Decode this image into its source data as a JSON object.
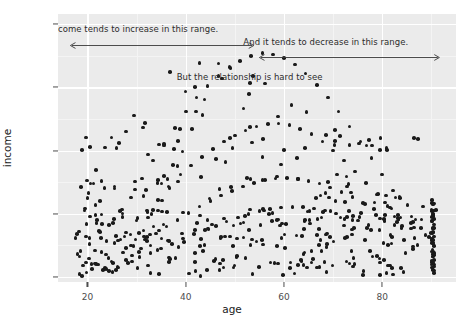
{
  "chart_data": {
    "type": "scatter",
    "title": "",
    "xlabel": "age",
    "ylabel": "income",
    "xlim": [
      14,
      95
    ],
    "ylim": [
      -4000,
      208000
    ],
    "x_ticks": [
      20,
      40,
      60,
      80
    ],
    "y_ticks": [
      0,
      50000,
      100000,
      150000,
      200000
    ],
    "x_tick_labels": [
      "20",
      "40",
      "60",
      "80"
    ],
    "y_tick_labels": [
      "0",
      "50000",
      "100000",
      "150000",
      "200000"
    ],
    "x_minor_ticks": [
      10,
      30,
      50,
      70,
      90
    ],
    "y_minor_ticks": [
      25000,
      75000,
      125000,
      175000
    ],
    "grid": true,
    "legend": "none",
    "point_color": "#1a1a1a",
    "panel_background": "#ebebeb",
    "gridline_color": "#ffffff",
    "annotations": [
      {
        "id": "annotation-increase",
        "text": "Income tends to increase in this range.",
        "text_x": 29.5,
        "text_y": 196000,
        "arrow": {
          "x_start": 16.3,
          "x_end": 54.2,
          "y": 188000,
          "style": "double-headed"
        }
      },
      {
        "id": "annotation-decrease",
        "text": "And it tends to decrease in this range.",
        "text_x": 68.5,
        "text_y": 186000,
        "arrow": {
          "x_start": 54.8,
          "x_end": 92.0,
          "y": 178000,
          "style": "double-headed"
        }
      },
      {
        "id": "annotation-hard-to-see",
        "text": "But the relationship is hard to see",
        "text_x": 53.0,
        "text_y": 158000,
        "arrow": null
      }
    ],
    "n_points": 560,
    "points": [
      [
        18.4,
        2100
      ],
      [
        19.1,
        8900
      ],
      [
        19.8,
        3400
      ],
      [
        20.3,
        14500
      ],
      [
        20.9,
        6200
      ],
      [
        21.5,
        21000
      ],
      [
        22.1,
        9800
      ],
      [
        22.7,
        31000
      ],
      [
        23.2,
        5400
      ],
      [
        23.8,
        17600
      ],
      [
        24.4,
        41000
      ],
      [
        24.9,
        12300
      ],
      [
        25.5,
        26800
      ],
      [
        26.1,
        8100
      ],
      [
        26.6,
        52000
      ],
      [
        27.2,
        19400
      ],
      [
        27.8,
        35200
      ],
      [
        28.3,
        11000
      ],
      [
        28.9,
        63000
      ],
      [
        29.4,
        24300
      ],
      [
        30.0,
        44600
      ],
      [
        30.6,
        15800
      ],
      [
        31.1,
        78000
      ],
      [
        31.7,
        29700
      ],
      [
        32.2,
        51200
      ],
      [
        32.8,
        19100
      ],
      [
        33.3,
        92000
      ],
      [
        33.9,
        34500
      ],
      [
        34.4,
        61000
      ],
      [
        35.0,
        22600
      ],
      [
        35.6,
        105000
      ],
      [
        36.1,
        39800
      ],
      [
        36.7,
        70400
      ],
      [
        37.2,
        26100
      ],
      [
        37.8,
        118000
      ],
      [
        38.3,
        45200
      ],
      [
        38.9,
        81000
      ],
      [
        39.4,
        30400
      ],
      [
        40.0,
        131000
      ],
      [
        40.6,
        50600
      ],
      [
        41.1,
        88000
      ],
      [
        41.7,
        33900
      ],
      [
        42.2,
        142000
      ],
      [
        42.8,
        55800
      ],
      [
        43.3,
        95000
      ],
      [
        43.9,
        37200
      ],
      [
        44.4,
        151000
      ],
      [
        45.0,
        60100
      ],
      [
        45.6,
        101000
      ],
      [
        46.1,
        40500
      ],
      [
        46.7,
        159000
      ],
      [
        47.2,
        64300
      ],
      [
        47.8,
        107000
      ],
      [
        48.3,
        43800
      ],
      [
        48.9,
        166000
      ],
      [
        49.4,
        68200
      ],
      [
        50.0,
        112000
      ],
      [
        50.6,
        46900
      ],
      [
        51.1,
        171000
      ],
      [
        51.7,
        71600
      ],
      [
        52.2,
        116000
      ],
      [
        52.8,
        49700
      ],
      [
        53.3,
        175000
      ],
      [
        53.9,
        74400
      ],
      [
        54.4,
        119000
      ],
      [
        55.0,
        52100
      ],
      [
        55.6,
        177000
      ],
      [
        56.1,
        76500
      ],
      [
        56.7,
        121000
      ],
      [
        57.2,
        53900
      ],
      [
        57.8,
        176000
      ],
      [
        58.3,
        77800
      ],
      [
        58.9,
        121500
      ],
      [
        59.4,
        55000
      ],
      [
        60.0,
        173000
      ],
      [
        60.6,
        78200
      ],
      [
        61.1,
        120000
      ],
      [
        61.7,
        55400
      ],
      [
        62.2,
        168000
      ],
      [
        62.8,
        77600
      ],
      [
        63.3,
        117000
      ],
      [
        63.9,
        55100
      ],
      [
        64.4,
        161000
      ],
      [
        65.0,
        76100
      ],
      [
        65.6,
        113000
      ],
      [
        66.1,
        54100
      ],
      [
        66.7,
        152000
      ],
      [
        67.2,
        73800
      ],
      [
        67.8,
        107000
      ],
      [
        68.3,
        52500
      ],
      [
        68.9,
        142000
      ],
      [
        69.4,
        70800
      ],
      [
        70.0,
        100000
      ],
      [
        70.6,
        50300
      ],
      [
        71.1,
        131000
      ],
      [
        71.7,
        67200
      ],
      [
        72.2,
        92000
      ],
      [
        72.8,
        47600
      ],
      [
        73.3,
        119000
      ],
      [
        73.9,
        63100
      ],
      [
        74.4,
        83500
      ],
      [
        75.0,
        44500
      ],
      [
        75.6,
        107000
      ],
      [
        76.1,
        58600
      ],
      [
        76.7,
        74500
      ],
      [
        77.2,
        41000
      ],
      [
        77.8,
        94000
      ],
      [
        78.3,
        53800
      ],
      [
        78.9,
        65200
      ],
      [
        79.4,
        37300
      ],
      [
        80.0,
        81000
      ],
      [
        80.6,
        48800
      ],
      [
        81.1,
        56000
      ],
      [
        81.7,
        33400
      ],
      [
        82.2,
        68500
      ],
      [
        83.0,
        43600
      ],
      [
        83.7,
        47000
      ],
      [
        84.4,
        29400
      ],
      [
        85.1,
        56800
      ],
      [
        85.8,
        38400
      ],
      [
        86.5,
        39000
      ],
      [
        87.2,
        25400
      ],
      [
        88.0,
        45600
      ],
      [
        88.8,
        33200
      ],
      [
        89.5,
        31500
      ],
      [
        90.2,
        21600
      ],
      [
        90.5,
        9800
      ],
      [
        90.5,
        17200
      ],
      [
        90.5,
        24600
      ],
      [
        90.5,
        32000
      ],
      [
        90.5,
        38900
      ],
      [
        90.5,
        45800
      ],
      [
        90.5,
        52400
      ],
      [
        90.5,
        58100
      ],
      [
        90.5,
        3200
      ],
      [
        90.5,
        13500
      ]
    ]
  }
}
